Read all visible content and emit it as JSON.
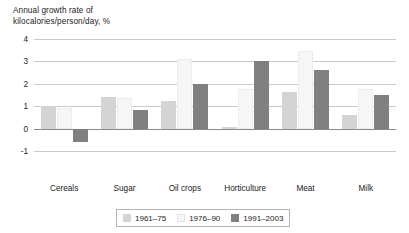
{
  "chart_data": {
    "type": "bar",
    "title": "",
    "ylabel": "Annual growth rate of kilocalories/person/day, %",
    "xlabel": "",
    "ylim": [
      -1,
      4
    ],
    "yticks": [
      -1,
      0,
      1,
      2,
      3,
      4
    ],
    "ytick_labels": [
      "-1",
      "0",
      "1",
      "2",
      "3",
      "4"
    ],
    "grid": true,
    "legend_position": "bottom",
    "categories": [
      "Cereals",
      "Sugar",
      "Oil crops",
      "Horticulture",
      "Meat",
      "Milk"
    ],
    "series": [
      {
        "name": "1961-75",
        "color": "#d4d4d4",
        "values": [
          1.0,
          1.4,
          1.25,
          0.05,
          1.65,
          0.6
        ]
      },
      {
        "name": "1976-90",
        "color": "#f6f6f6",
        "values": [
          0.9,
          1.35,
          3.1,
          1.75,
          3.45,
          1.75
        ]
      },
      {
        "name": "1991-2003",
        "color": "#808080",
        "values": [
          -0.6,
          0.85,
          2.0,
          3.0,
          2.6,
          1.5
        ]
      }
    ]
  },
  "axis": {
    "title_line1": "Annual growth rate of",
    "title_line2": "kilocalories/person/day, %"
  },
  "legend": {
    "items": [
      {
        "label": "1961–75",
        "color": "#d4d4d4"
      },
      {
        "label": "1976–90",
        "color": "#f6f6f6"
      },
      {
        "label": "1991–2003",
        "color": "#808080"
      }
    ]
  },
  "colors": {
    "series1": "#d4d4d4",
    "series2": "#f6f6f6",
    "series3": "#808080",
    "gridline": "#c9c9c9",
    "axis": "#8a8a8a",
    "text": "#1a1a1a"
  }
}
